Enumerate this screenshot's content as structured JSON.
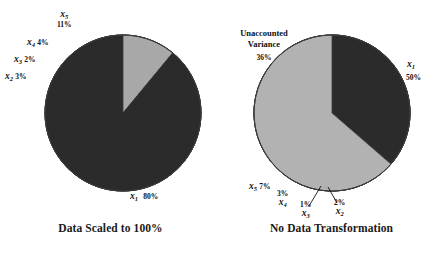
{
  "figure": {
    "background": "#ffffff",
    "panels": [
      {
        "id": "left",
        "caption": "Data Scaled to 100%",
        "center": [
          123,
          113
        ],
        "radius": 78
      },
      {
        "id": "right",
        "caption": "No Data Transformation",
        "center": [
          111,
          113
        ],
        "radius": 78
      }
    ]
  },
  "labels": {
    "x1": "x",
    "x1sub": "1",
    "x2": "x",
    "x2sub": "2",
    "x3": "x",
    "x3sub": "3",
    "x4": "x",
    "x4sub": "4",
    "x5": "x",
    "x5sub": "5",
    "unaccounted_line1": "Unaccounted",
    "unaccounted_line2": "Variance"
  },
  "left_pcts": {
    "x1": "80%",
    "x2": "3%",
    "x3": "2%",
    "x4": "4%",
    "x5": "11%"
  },
  "right_pcts": {
    "x1": "50%",
    "x2": "2%",
    "x3": "1%",
    "x4": "3%",
    "x5": "7%",
    "unaccounted": "36%"
  },
  "colors": {
    "x1": "#dcdcda",
    "x2": "#585858",
    "x3": "#3a3a3a",
    "x4": "#a8a8a8",
    "x5": "#2b2b2b",
    "unaccounted": "#b2b2b2",
    "outline": "#3a3a3a",
    "text": "#101010"
  },
  "chart_data": [
    {
      "type": "pie",
      "title": "Data Scaled to 100%",
      "categories": [
        "x1",
        "x2",
        "x3",
        "x4",
        "x5"
      ],
      "labels": [
        "x₁",
        "x₂",
        "x₃",
        "x₄",
        "x₅"
      ],
      "values": [
        80,
        3,
        2,
        4,
        11
      ],
      "unit": "percent",
      "start_angle_deg": 90,
      "direction": "counterclockwise",
      "legend": "none",
      "annotations": [
        "x₁ 80%",
        "x₂ 3%",
        "x₃ 2%",
        "x₄ 4%",
        "x₅ 11%"
      ]
    },
    {
      "type": "pie",
      "title": "No Data Transformation",
      "categories": [
        "x1",
        "x2",
        "x3",
        "x4",
        "x5",
        "Unaccounted Variance"
      ],
      "labels": [
        "x₁",
        "x₂",
        "x₃",
        "x₄",
        "x₅",
        "Unaccounted Variance"
      ],
      "values": [
        50,
        2,
        1,
        3,
        7,
        36
      ],
      "unit": "percent",
      "start_angle_deg": 90,
      "direction": "counterclockwise",
      "legend": "none",
      "annotations": [
        "x₁ 50%",
        "x₂ 2%",
        "x₃ 1%",
        "x₄ 3%",
        "x₅ 7%",
        "Unaccounted Variance 36%"
      ]
    }
  ]
}
